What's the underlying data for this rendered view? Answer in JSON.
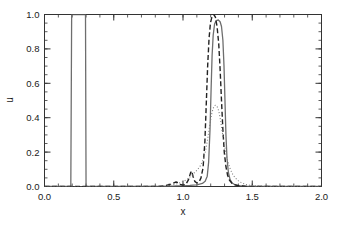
{
  "chart_data": {
    "type": "line",
    "title": "",
    "xlabel": "x",
    "ylabel": "u",
    "xlim": [
      0.0,
      2.0
    ],
    "ylim": [
      0.0,
      1.0
    ],
    "xticks": [
      0.0,
      0.5,
      1.0,
      1.5,
      2.0
    ],
    "xtick_labels": [
      "0.0",
      "0.5",
      "1.0",
      "1.5",
      "2.0"
    ],
    "yticks": [
      0.0,
      0.2,
      0.4,
      0.6,
      0.8,
      1.0
    ],
    "ytick_labels": [
      "0.0",
      "0.2",
      "0.4",
      "0.6",
      "0.8",
      "1.0"
    ],
    "x_minor_step": 0.1,
    "y_minor_step": 0.05,
    "grid": false,
    "legend": "none",
    "ticks_inward": true,
    "box_frame": true,
    "series": [
      {
        "name": "solid",
        "style": "solid",
        "color": "#6e6e6e",
        "width": 1.3,
        "points": [
          [
            0.0,
            0.0
          ],
          [
            0.19,
            0.0
          ],
          [
            0.196,
            1.0
          ],
          [
            0.2,
            1.0
          ],
          [
            0.25,
            1.0
          ],
          [
            0.296,
            1.0
          ],
          [
            0.3,
            0.0
          ],
          [
            0.4,
            0.0
          ],
          [
            0.6,
            0.0
          ],
          [
            0.8,
            0.0
          ],
          [
            0.9,
            0.0
          ],
          [
            0.95,
            0.003
          ],
          [
            1.0,
            0.004
          ],
          [
            1.05,
            0.006
          ],
          [
            1.1,
            0.01
          ],
          [
            1.14,
            0.018
          ],
          [
            1.16,
            0.03
          ],
          [
            1.175,
            0.06
          ],
          [
            1.185,
            0.14
          ],
          [
            1.195,
            0.33
          ],
          [
            1.203,
            0.57
          ],
          [
            1.21,
            0.76
          ],
          [
            1.218,
            0.88
          ],
          [
            1.228,
            0.945
          ],
          [
            1.24,
            0.965
          ],
          [
            1.255,
            0.968
          ],
          [
            1.268,
            0.958
          ],
          [
            1.278,
            0.93
          ],
          [
            1.288,
            0.85
          ],
          [
            1.296,
            0.7
          ],
          [
            1.303,
            0.5
          ],
          [
            1.31,
            0.3
          ],
          [
            1.318,
            0.16
          ],
          [
            1.328,
            0.08
          ],
          [
            1.34,
            0.04
          ],
          [
            1.355,
            0.02
          ],
          [
            1.375,
            0.01
          ],
          [
            1.4,
            0.005
          ],
          [
            1.45,
            0.002
          ],
          [
            1.5,
            0.0
          ],
          [
            1.7,
            0.0
          ],
          [
            2.0,
            0.0
          ]
        ]
      },
      {
        "name": "dashed",
        "style": "dashed",
        "color": "#222222",
        "width": 1.4,
        "points": [
          [
            0.0,
            0.0
          ],
          [
            0.3,
            0.0
          ],
          [
            0.6,
            0.0
          ],
          [
            0.82,
            0.0
          ],
          [
            0.86,
            0.004
          ],
          [
            0.9,
            0.01
          ],
          [
            0.93,
            0.02
          ],
          [
            0.95,
            0.026
          ],
          [
            0.965,
            0.022
          ],
          [
            0.98,
            0.012
          ],
          [
            1.0,
            0.008
          ],
          [
            1.02,
            0.012
          ],
          [
            1.04,
            0.04
          ],
          [
            1.055,
            0.08
          ],
          [
            1.063,
            0.09
          ],
          [
            1.072,
            0.06
          ],
          [
            1.085,
            0.03
          ],
          [
            1.1,
            0.02
          ],
          [
            1.115,
            0.025
          ],
          [
            1.13,
            0.05
          ],
          [
            1.145,
            0.11
          ],
          [
            1.158,
            0.26
          ],
          [
            1.168,
            0.48
          ],
          [
            1.178,
            0.7
          ],
          [
            1.188,
            0.86
          ],
          [
            1.198,
            0.95
          ],
          [
            1.21,
            0.99
          ],
          [
            1.222,
            1.0
          ],
          [
            1.234,
            0.985
          ],
          [
            1.246,
            0.93
          ],
          [
            1.258,
            0.83
          ],
          [
            1.268,
            0.68
          ],
          [
            1.278,
            0.5
          ],
          [
            1.288,
            0.33
          ],
          [
            1.298,
            0.2
          ],
          [
            1.31,
            0.115
          ],
          [
            1.322,
            0.065
          ],
          [
            1.336,
            0.036
          ],
          [
            1.352,
            0.02
          ],
          [
            1.372,
            0.011
          ],
          [
            1.395,
            0.006
          ],
          [
            1.425,
            0.003
          ],
          [
            1.46,
            0.001
          ],
          [
            1.5,
            0.0
          ],
          [
            1.7,
            0.0
          ],
          [
            2.0,
            0.0
          ]
        ]
      },
      {
        "name": "dotted",
        "style": "dotted",
        "color": "#7d7d7d",
        "width": 1.1,
        "points": [
          [
            0.0,
            0.0
          ],
          [
            0.4,
            0.0
          ],
          [
            0.7,
            0.0
          ],
          [
            0.85,
            0.002
          ],
          [
            0.9,
            0.006
          ],
          [
            0.95,
            0.014
          ],
          [
            1.0,
            0.028
          ],
          [
            1.03,
            0.042
          ],
          [
            1.06,
            0.062
          ],
          [
            1.085,
            0.082
          ],
          [
            1.105,
            0.098
          ],
          [
            1.125,
            0.12
          ],
          [
            1.145,
            0.155
          ],
          [
            1.162,
            0.205
          ],
          [
            1.178,
            0.275
          ],
          [
            1.192,
            0.35
          ],
          [
            1.205,
            0.415
          ],
          [
            1.218,
            0.455
          ],
          [
            1.232,
            0.472
          ],
          [
            1.245,
            0.468
          ],
          [
            1.258,
            0.44
          ],
          [
            1.27,
            0.39
          ],
          [
            1.282,
            0.325
          ],
          [
            1.295,
            0.26
          ],
          [
            1.308,
            0.2
          ],
          [
            1.322,
            0.15
          ],
          [
            1.338,
            0.108
          ],
          [
            1.355,
            0.076
          ],
          [
            1.375,
            0.052
          ],
          [
            1.398,
            0.034
          ],
          [
            1.422,
            0.022
          ],
          [
            1.45,
            0.013
          ],
          [
            1.48,
            0.007
          ],
          [
            1.515,
            0.004
          ],
          [
            1.555,
            0.002
          ],
          [
            1.6,
            0.001
          ],
          [
            1.7,
            0.0
          ],
          [
            2.0,
            0.0
          ]
        ]
      }
    ],
    "annotations": []
  },
  "figure": {
    "background_color": "#ffffff",
    "axis_color": "#333333"
  }
}
